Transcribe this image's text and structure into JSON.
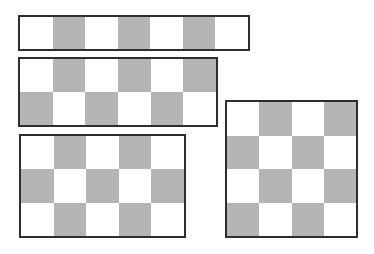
{
  "diagram": {
    "title": "",
    "colors": {
      "dark": "#b5b5b5",
      "light": "#ffffff",
      "border": "#2e2e2e"
    },
    "grids": [
      {
        "name": "grid-7x1",
        "cols": 7,
        "rows": 1,
        "x": 18,
        "y": 15,
        "width": 232,
        "height": 36,
        "first_cell": "light"
      },
      {
        "name": "grid-6x2",
        "cols": 6,
        "rows": 2,
        "x": 18,
        "y": 57,
        "width": 200,
        "height": 70,
        "first_cell": "light"
      },
      {
        "name": "grid-5x3",
        "cols": 5,
        "rows": 3,
        "x": 19,
        "y": 134,
        "width": 167,
        "height": 104,
        "first_cell": "light"
      },
      {
        "name": "grid-4x4",
        "cols": 4,
        "rows": 4,
        "x": 225,
        "y": 100,
        "width": 133,
        "height": 138,
        "first_cell": "light"
      }
    ]
  }
}
